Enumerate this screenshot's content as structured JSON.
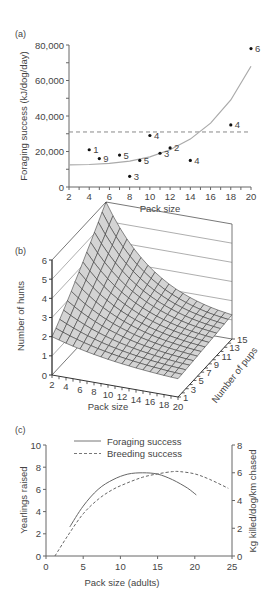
{
  "chart_data": [
    {
      "panel": "(a)",
      "type": "scatter",
      "title": "",
      "xlabel": "Pack size",
      "ylabel": "Foraging success (kJ/dog/day)",
      "xlim": [
        2,
        20
      ],
      "ylim": [
        0,
        80000
      ],
      "xticks": [
        "2",
        "4",
        "6",
        "8",
        "10",
        "12",
        "14",
        "16",
        "18",
        "20"
      ],
      "yticks": [
        "0",
        "20,000",
        "40,000",
        "60,000",
        "80,000"
      ],
      "points": [
        {
          "x": 4,
          "y": 21000,
          "label": "1"
        },
        {
          "x": 5,
          "y": 16000,
          "label": "9"
        },
        {
          "x": 7,
          "y": 18000,
          "label": "5"
        },
        {
          "x": 8,
          "y": 6000,
          "label": "3"
        },
        {
          "x": 9,
          "y": 15000,
          "label": "5"
        },
        {
          "x": 10,
          "y": 29000,
          "label": "4"
        },
        {
          "x": 11,
          "y": 19000,
          "label": "3"
        },
        {
          "x": 12,
          "y": 22000,
          "label": "2"
        },
        {
          "x": 14,
          "y": 15000,
          "label": "4"
        },
        {
          "x": 18,
          "y": 35000,
          "label": "4"
        },
        {
          "x": 20,
          "y": 78000,
          "label": "6"
        }
      ],
      "fit_curve": {
        "x": [
          2,
          4,
          6,
          8,
          10,
          12,
          14,
          16,
          18,
          20
        ],
        "y": [
          12500,
          12700,
          13300,
          14600,
          17000,
          21000,
          27000,
          36000,
          49000,
          68000
        ]
      },
      "reference_line": {
        "y": 31000,
        "style": "dashed"
      },
      "grid": false
    },
    {
      "panel": "(b)",
      "type": "surface",
      "title": "",
      "xlabel": "Pack size",
      "ylabel": "Number of pups",
      "zlabel": "Number of hunts",
      "xticks": [
        "2",
        "4",
        "6",
        "8",
        "10",
        "12",
        "14",
        "16",
        "18",
        "20"
      ],
      "yticks": [
        "1",
        "3",
        "5",
        "7",
        "9",
        "11",
        "13",
        "15"
      ],
      "zticks": [
        "0",
        "1",
        "2",
        "3",
        "4",
        "5",
        "6"
      ],
      "zlim": [
        0,
        6
      ],
      "corner_values": {
        "pack2_pups1": 2.0,
        "pack2_pups15": 6.0,
        "pack20_pups1": 0.6,
        "pack20_pups15": 2.4
      },
      "grid": true
    },
    {
      "panel": "(c)",
      "type": "line",
      "title": "",
      "xlabel": "Pack size (adults)",
      "ylabel": "Yearlings raised",
      "ylabel_right": "Kg killed/dog/km chased",
      "xlim": [
        0,
        25
      ],
      "ylim": [
        0,
        10
      ],
      "ylim_right": [
        0,
        8
      ],
      "xticks": [
        "0",
        "5",
        "10",
        "15",
        "20",
        "25"
      ],
      "yticks": [
        "0",
        "2",
        "4",
        "6",
        "8",
        "10"
      ],
      "yticks_right": [
        "0",
        "2",
        "4",
        "6",
        "8"
      ],
      "legend": [
        "Foraging success",
        "Breeding success"
      ],
      "legend_position": "top",
      "series": [
        {
          "name": "Foraging success",
          "style": "solid",
          "axis": "right",
          "x": [
            3.2,
            5,
            7,
            9,
            11,
            13,
            15,
            17,
            19,
            20.2
          ],
          "y": [
            2.1,
            3.6,
            4.8,
            5.5,
            5.9,
            6.0,
            5.9,
            5.5,
            4.9,
            4.4
          ]
        },
        {
          "name": "Breeding success",
          "style": "dashed",
          "axis": "left",
          "x": [
            1.2,
            3,
            5,
            7,
            9,
            11,
            13,
            15,
            17,
            18,
            20,
            22,
            24.5
          ],
          "y": [
            0,
            1.9,
            3.8,
            5.1,
            6.0,
            6.6,
            7.1,
            7.4,
            7.6,
            7.6,
            7.4,
            6.9,
            6.1
          ]
        }
      ],
      "grid": false
    }
  ],
  "panels": {
    "a": {
      "tag": "(a)"
    },
    "b": {
      "tag": "(b)"
    },
    "c": {
      "tag": "(c)"
    }
  }
}
